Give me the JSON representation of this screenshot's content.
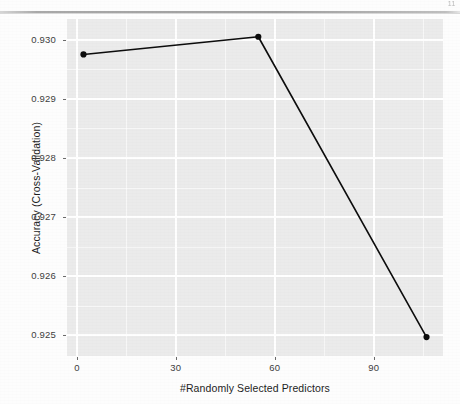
{
  "page": {
    "page_number": "11",
    "background_color": "#fdfdfd"
  },
  "chart_data": {
    "type": "line",
    "title": "",
    "subtitle": "",
    "xlabel": "#Randomly Selected Predictors",
    "ylabel": "Accuracy (Cross-Validation)",
    "x": [
      2,
      55,
      106
    ],
    "values": [
      0.92975,
      0.93005,
      0.92497
    ],
    "series": [
      {
        "name": "Accuracy (Cross-Validation)",
        "x": [
          2,
          55,
          106
        ],
        "values": [
          0.92975,
          0.93005,
          0.92497
        ]
      }
    ],
    "xlim": [
      -3,
      111
    ],
    "ylim": [
      0.92465,
      0.93035
    ],
    "x_ticks": [
      0,
      30,
      60,
      90
    ],
    "x_tick_labels": [
      "0",
      "30",
      "60",
      "90"
    ],
    "y_ticks": [
      0.925,
      0.926,
      0.927,
      0.928,
      0.929,
      0.93
    ],
    "y_tick_labels": [
      "0.925",
      "0.926",
      "0.927",
      "0.928",
      "0.929",
      "0.930"
    ],
    "x_minor_ticks": [
      15,
      45,
      75,
      105
    ],
    "y_minor_ticks": [
      0.9255,
      0.9265,
      0.9275,
      0.9285,
      0.9295
    ],
    "grid": true,
    "legend": "none",
    "line_color": "#0d0d0d",
    "point_color": "#0d0d0d",
    "panel_background": "#ebebeb",
    "gridline_color": "#ffffff",
    "line_width": 1.6,
    "point_radius": 3.1,
    "annotations": []
  }
}
